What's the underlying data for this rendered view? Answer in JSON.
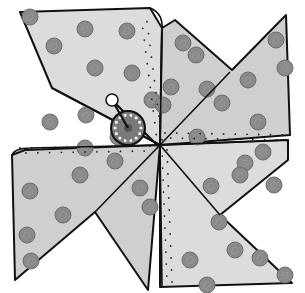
{
  "illustration": {
    "subject": "Pinwheel",
    "colors": {
      "background": "#ffffff",
      "blade_fill": "#dcdcdc",
      "blade_fill_shade": "#cfcfcf",
      "polka_dot": "#8a8a8a",
      "outline": "#111111",
      "center_cap": "#7a7a7a",
      "center_ring_dots": "#ffffff",
      "pin_head": "#ffffff"
    },
    "blades": [
      {
        "name": "top-left",
        "points": "20,12 150,8 162,28 160,145 52,88"
      },
      {
        "name": "top-right",
        "points": "162,28 175,20 232,70 286,15 290,135 160,145"
      },
      {
        "name": "bottom-right",
        "points": "160,145 288,140 288,160 220,215 292,283 160,287"
      },
      {
        "name": "bottom-left",
        "points": "160,145 148,290 95,212 15,280 12,155 25,150"
      }
    ],
    "center": {
      "x": 128,
      "y": 128,
      "r": 17
    },
    "pin_head": {
      "x": 112,
      "y": 100,
      "r": 6
    },
    "pivot": {
      "x": 158,
      "y": 146
    },
    "dots": [
      [
        30,
        17
      ],
      [
        85,
        29
      ],
      [
        127,
        31
      ],
      [
        95,
        68
      ],
      [
        132,
        73
      ],
      [
        54,
        46
      ],
      [
        86,
        115
      ],
      [
        50,
        122
      ],
      [
        118,
        137
      ],
      [
        152,
        100
      ],
      [
        183,
        43
      ],
      [
        196,
        55
      ],
      [
        207,
        89
      ],
      [
        171,
        87
      ],
      [
        222,
        103
      ],
      [
        248,
        80
      ],
      [
        276,
        40
      ],
      [
        285,
        68
      ],
      [
        258,
        122
      ],
      [
        197,
        137
      ],
      [
        163,
        105
      ],
      [
        245,
        163
      ],
      [
        263,
        152
      ],
      [
        211,
        186
      ],
      [
        240,
        175
      ],
      [
        274,
        185
      ],
      [
        219,
        222
      ],
      [
        235,
        250
      ],
      [
        260,
        258
      ],
      [
        285,
        275
      ],
      [
        190,
        260
      ],
      [
        207,
        285
      ],
      [
        85,
        148
      ],
      [
        115,
        161
      ],
      [
        80,
        175
      ],
      [
        30,
        191
      ],
      [
        63,
        215
      ],
      [
        27,
        235
      ],
      [
        31,
        261
      ],
      [
        150,
        207
      ],
      [
        140,
        188
      ]
    ],
    "stipple_lines": [
      {
        "from": [
          145,
          22
        ],
        "to": [
          160,
          140
        ]
      },
      {
        "from": [
          165,
          135
        ],
        "to": [
          288,
          137
        ]
      },
      {
        "from": [
          165,
          150
        ],
        "to": [
          170,
          282
        ]
      },
      {
        "from": [
          20,
          150
        ],
        "to": [
          150,
          148
        ]
      }
    ]
  }
}
